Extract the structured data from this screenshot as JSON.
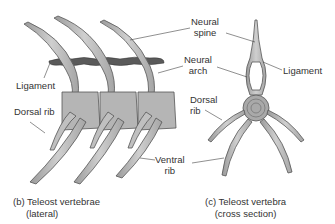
{
  "figure": {
    "panels": [
      {
        "id": "b",
        "caption_line1": "(b) Teleost vertebrae",
        "caption_line2": "(lateral)",
        "labels": {
          "ligament": "Ligament",
          "dorsal_rib": "Dorsal rib",
          "neural_spine_1": "Neural",
          "neural_spine_2": "spine",
          "neural_arch_1": "Neural",
          "neural_arch_2": "arch",
          "ventral_rib_1": "Ventral",
          "ventral_rib_2": "rib"
        }
      },
      {
        "id": "c",
        "caption_line1": "(c) Teleost vertebra",
        "caption_line2": "(cross section)",
        "labels": {
          "ligament": "Ligament",
          "dorsal_rib_1": "Dorsal",
          "dorsal_rib_2": "rib"
        }
      }
    ],
    "colors": {
      "bone_fill": "#b9b9b9",
      "bone_stroke": "#555555",
      "ligament_fill": "#5a5a5a",
      "leader_line": "#444444"
    }
  }
}
